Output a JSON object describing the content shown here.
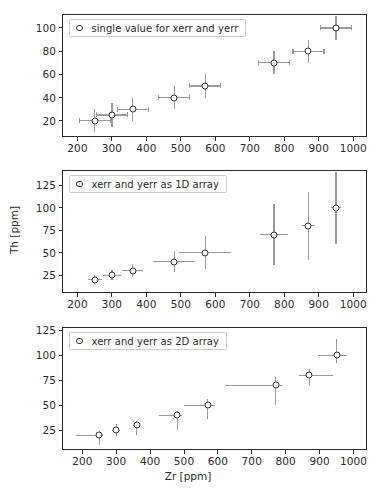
{
  "figure": {
    "clipped_top_text": "",
    "width": 376,
    "height": 494,
    "background": "#ffffff",
    "marker_edge_color": "#333333",
    "errorbar_color": "#9a9a9a",
    "axis_color": "#2b2b2b"
  },
  "shared": {
    "xlabel": "Zr [ppm]",
    "ylabel": "Th [ppm]",
    "x_ticks": [
      200,
      300,
      400,
      500,
      600,
      700,
      800,
      900,
      1000
    ],
    "x": [
      250,
      300,
      360,
      480,
      570,
      770,
      870,
      950
    ],
    "y": [
      20,
      25,
      30,
      40,
      50,
      70,
      80,
      100
    ]
  },
  "chart_data": [
    {
      "type": "scatter",
      "panel": "top",
      "title": "",
      "legend": "single value for xerr and yerr",
      "legend_position": "upper left",
      "xlabel": "",
      "ylabel": "",
      "x": [
        250,
        300,
        360,
        480,
        570,
        770,
        870,
        950
      ],
      "y": [
        20,
        25,
        30,
        40,
        50,
        70,
        80,
        100
      ],
      "xerr": [
        45,
        45,
        45,
        45,
        45,
        45,
        45,
        45
      ],
      "yerr": [
        10,
        10,
        10,
        10,
        10,
        10,
        10,
        10
      ],
      "xerr_mode": "single value",
      "yerr_mode": "single value",
      "x_ticks": [
        200,
        300,
        400,
        500,
        600,
        700,
        800,
        900,
        1000
      ],
      "y_ticks": [
        20,
        40,
        60,
        80,
        100
      ],
      "xlim": [
        155,
        1040
      ],
      "ylim": [
        6,
        112
      ],
      "grid": false
    },
    {
      "type": "scatter",
      "panel": "middle",
      "title": "",
      "legend": "xerr and yerr as 1D array",
      "legend_position": "upper left",
      "xlabel": "",
      "ylabel": "Th [ppm]",
      "x": [
        250,
        300,
        360,
        480,
        570,
        770,
        870,
        950
      ],
      "y": [
        20,
        25,
        30,
        40,
        50,
        70,
        80,
        100
      ],
      "xerr": [
        20,
        25,
        30,
        60,
        75,
        40,
        20,
        15
      ],
      "yerr": [
        5,
        6,
        7,
        12,
        18,
        34,
        38,
        40
      ],
      "xerr_mode": "1D array",
      "yerr_mode": "1D array",
      "x_ticks": [
        200,
        300,
        400,
        500,
        600,
        700,
        800,
        900,
        1000
      ],
      "y_ticks": [
        25,
        50,
        75,
        100,
        125
      ],
      "xlim": [
        155,
        1040
      ],
      "ylim": [
        5,
        142
      ],
      "grid": false
    },
    {
      "type": "scatter",
      "panel": "bottom",
      "title": "",
      "legend": "xerr and yerr as 2D array",
      "legend_position": "upper left",
      "xlabel": "Zr [ppm]",
      "ylabel": "",
      "x": [
        250,
        300,
        360,
        480,
        570,
        770,
        870,
        950
      ],
      "y": [
        20,
        25,
        30,
        40,
        50,
        70,
        80,
        100
      ],
      "xerr_lower": [
        70,
        12,
        10,
        55,
        70,
        150,
        30,
        55
      ],
      "xerr_upper": [
        12,
        10,
        10,
        15,
        20,
        20,
        70,
        30
      ],
      "yerr_lower": [
        10,
        6,
        10,
        15,
        14,
        20,
        10,
        8
      ],
      "yerr_upper": [
        4,
        6,
        4,
        4,
        6,
        8,
        6,
        16
      ],
      "xerr_mode": "2D array",
      "yerr_mode": "2D array",
      "x_ticks": [
        200,
        300,
        400,
        500,
        600,
        700,
        800,
        900,
        1000
      ],
      "y_ticks": [
        25,
        50,
        75,
        100,
        125
      ],
      "xlim": [
        140,
        1040
      ],
      "ylim": [
        5,
        128
      ],
      "grid": false
    }
  ]
}
